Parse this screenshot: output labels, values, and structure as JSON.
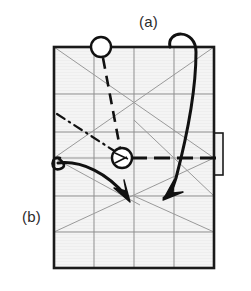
{
  "figure": {
    "title_labels": {
      "a": "(a)",
      "b": "(b)"
    },
    "kind": "origami-fold-diagram",
    "colors": {
      "paper_fill": "#f2f2f2",
      "outline": "#1a1a1a",
      "crease_grid": "#8c8c8c",
      "crease_diagonal": "#999999",
      "fold_line": "#111111",
      "label_text": "#2b2b2b",
      "background": "#ffffff"
    },
    "paper": {
      "left": 54,
      "top": 47,
      "right": 214,
      "bottom": 268,
      "grid_columns": 4,
      "grid_rows": 6,
      "outline_width": 2.6
    },
    "flap": {
      "name": "right-edge-flap",
      "left": 214,
      "top": 133,
      "width": 9,
      "height": 42
    },
    "markers": [
      {
        "name": "pivot-circle-top",
        "cx": 101,
        "cy": 47,
        "r": 10
      },
      {
        "name": "pivot-circle-center",
        "cx": 122,
        "cy": 158,
        "r": 10
      }
    ],
    "creases": {
      "chain_line": "dash-dot reference line from left edge to center circle",
      "dashed_valley": "thick dashed horizontal fold line through center circle",
      "dashed_oblique": "thick dashed oblique fold line from top circle to center circle"
    },
    "arrows": [
      {
        "name": "fold-arrow-a",
        "note": "long curved arrow looping over the top edge down to lower right"
      },
      {
        "name": "fold-arrow-b",
        "note": "curved arrow starting at the left edge hooking right and down"
      }
    ]
  }
}
